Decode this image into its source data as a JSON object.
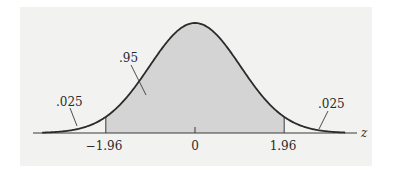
{
  "chart_data": {
    "type": "area",
    "title": "",
    "xlabel": "z",
    "ylabel": "",
    "distribution": "standard normal",
    "x_ticks": [
      {
        "value": -1.96,
        "label": "−1.96"
      },
      {
        "value": 0,
        "label": "0"
      },
      {
        "value": 1.96,
        "label": "1.96"
      }
    ],
    "regions": [
      {
        "name": "left-tail",
        "from": null,
        "to": -1.96,
        "area": 0.025,
        "label": ".025",
        "shaded": false
      },
      {
        "name": "center",
        "from": -1.96,
        "to": 1.96,
        "area": 0.95,
        "label": ".95",
        "shaded": true
      },
      {
        "name": "right-tail",
        "from": 1.96,
        "to": null,
        "area": 0.025,
        "label": ".025",
        "shaded": false
      }
    ],
    "xlim": [
      -3.3,
      3.3
    ],
    "grid": false,
    "legend": null
  },
  "colors": {
    "panel_bg": "#f2f2f1",
    "shade": "#d4d4d4",
    "curve": "#2b2b2b",
    "axis": "#3a3a3a"
  },
  "labels": {
    "left_tail": ".025",
    "center": ".95",
    "right_tail": ".025",
    "axis_var": "z",
    "tick_neg": "−1.96",
    "tick_zero": "0",
    "tick_pos": "1.96"
  }
}
